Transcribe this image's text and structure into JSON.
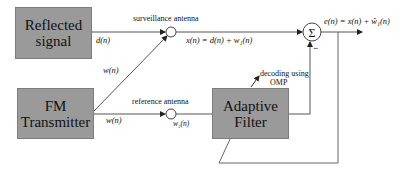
{
  "blocks": {
    "reflected_signal": {
      "line1": "Reflected",
      "line2": "signal"
    },
    "fm_transmitter": {
      "line1": "FM",
      "line2": "Transmitter"
    },
    "adaptive_filter": {
      "line1": "Adaptive",
      "line2": "Filter"
    }
  },
  "labels": {
    "surveillance_antenna": "surveillance antenna",
    "reference_antenna": "reference antenna",
    "decoding_line1": "decoding using",
    "decoding_line2": "OMP",
    "sum_symbol": "Σ",
    "minus_sign": "−"
  },
  "signals": {
    "d_n": "d(n)",
    "w_n_diag": "w(n)",
    "w_n_ref": "w(n)",
    "x_n": "x(n) = d(n) + w₁(n)",
    "w2_n": "w₂(n)",
    "e_n": "e(n) = x(n) + ŵ₁(n)"
  },
  "colors": {
    "block_fill": "#9a9a9a",
    "line": "#555555"
  }
}
